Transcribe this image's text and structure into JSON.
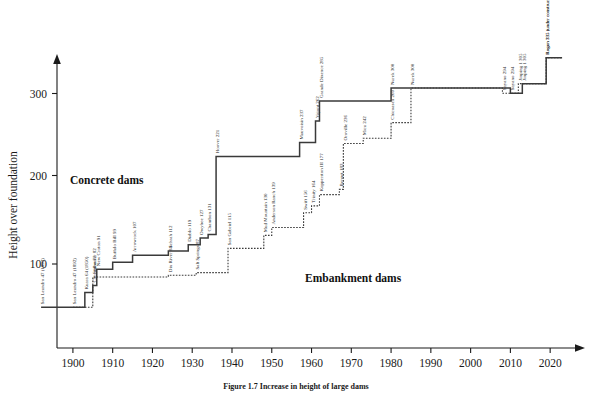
{
  "figure": {
    "caption": "Figure 1.7 Increase in height of large dams",
    "background": "#ffffff",
    "line_color": "#3a3a3a"
  },
  "chart_data": {
    "type": "line",
    "title": "",
    "xlabel": "",
    "ylabel": "Height over foundation",
    "xlim": [
      1896,
      2027
    ],
    "ylim": [
      0,
      330
    ],
    "xticks": [
      1900,
      1910,
      1920,
      1930,
      1940,
      1950,
      1960,
      1970,
      1980,
      1990,
      2000,
      2010,
      2020
    ],
    "yticks": [
      100,
      200,
      300
    ],
    "grid": false,
    "legend": "none",
    "annotations": [
      {
        "text": "Concrete dams",
        "x": 1918,
        "y": 197
      },
      {
        "text": "Embankment dams",
        "x": 1966,
        "y": 88
      }
    ],
    "series": [
      {
        "name": "Concrete dams",
        "style": "solid",
        "points": [
          {
            "label": "San Leandro 47 (1892)",
            "year": 1892,
            "height": 47
          },
          {
            "label": "Kuara 64 (1850)",
            "year": 1903,
            "height": 64
          },
          {
            "label": "Cheesman 72",
            "year": 1905,
            "height": 72
          },
          {
            "label": "New Croton 91",
            "year": 1906,
            "height": 91
          },
          {
            "label": "Buffalo Bill 99",
            "year": 1910,
            "height": 99
          },
          {
            "label": "Arrowrock 107",
            "year": 1915,
            "height": 107
          },
          {
            "label": "Schrah 112",
            "year": 1924,
            "height": 112
          },
          {
            "label": "Diablo 119",
            "year": 1929,
            "height": 119
          },
          {
            "label": "Owyhee 127",
            "year": 1932,
            "height": 127
          },
          {
            "label": "Chambon 131",
            "year": 1934,
            "height": 131
          },
          {
            "label": "Hoover 221",
            "year": 1936,
            "height": 221
          },
          {
            "label": "Mauvoisin 237",
            "year": 1957,
            "height": 237
          },
          {
            "label": "Vajont 262",
            "year": 1961,
            "height": 262
          },
          {
            "label": "Grande Dixence 285",
            "year": 1962,
            "height": 285
          },
          {
            "label": "Nurek 300",
            "year": 1980,
            "height": 300
          },
          {
            "label": "Sayano 294",
            "year": 2010,
            "height": 294
          },
          {
            "label": "Jinping 1 305",
            "year": 2013,
            "height": 305
          },
          {
            "label": "Rogun 335 (under construction)",
            "year": 2019,
            "height": 335
          }
        ]
      },
      {
        "name": "Embankment dams",
        "style": "dotted",
        "points": [
          {
            "label": "San Leandro 47 (1892)",
            "year": 1900,
            "height": 47
          },
          {
            "label": "Stillwater 82",
            "year": 1905,
            "height": 82
          },
          {
            "label": "Dix River 84",
            "year": 1924,
            "height": 84
          },
          {
            "label": "Salt Springs 87",
            "year": 1931,
            "height": 87
          },
          {
            "label": "San Gabriel 115",
            "year": 1939,
            "height": 115
          },
          {
            "label": "Mud Mountain 130",
            "year": 1948,
            "height": 130
          },
          {
            "label": "Anderson Ranch 139",
            "year": 1950,
            "height": 139
          },
          {
            "label": "Swift 156",
            "year": 1958,
            "height": 156
          },
          {
            "label": "Trinity 164",
            "year": 1960,
            "height": 164
          },
          {
            "label": "Kopperston III 177",
            "year": 1962,
            "height": 177
          },
          {
            "label": "Bennet 183",
            "year": 1967,
            "height": 183
          },
          {
            "label": "Oroville 236",
            "year": 1968,
            "height": 236
          },
          {
            "label": "Mica 242",
            "year": 1973,
            "height": 242
          },
          {
            "label": "Chicoasen 260",
            "year": 1980,
            "height": 260
          },
          {
            "label": "Nurek 300",
            "year": 1985,
            "height": 300
          },
          {
            "label": "Sayano 294",
            "year": 2008,
            "height": 294
          },
          {
            "label": "Jinping 1 305",
            "year": 2012,
            "height": 305
          },
          {
            "label": "Rogun 335 (under construction)",
            "year": 2019,
            "height": 335
          }
        ]
      }
    ]
  }
}
